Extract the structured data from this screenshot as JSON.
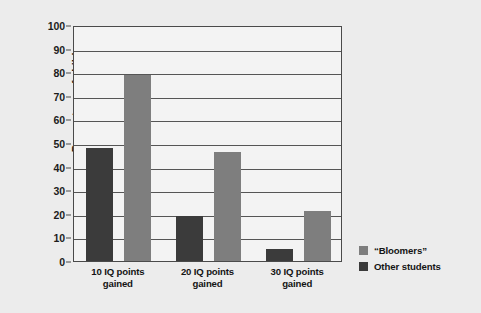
{
  "chart_data": {
    "type": "bar",
    "title": "",
    "xlabel": "",
    "ylabel": "Percentage of children",
    "ylim": [
      0,
      100
    ],
    "ytick_step": 10,
    "yticks": [
      0,
      10,
      20,
      30,
      40,
      50,
      60,
      70,
      80,
      90,
      100
    ],
    "grid": true,
    "categories": [
      "10 IQ points gained",
      "20 IQ points gained",
      "30 IQ points gained"
    ],
    "category_lines": [
      [
        "10 IQ points",
        "gained"
      ],
      [
        "20 IQ points",
        "gained"
      ],
      [
        "30 IQ points",
        "gained"
      ]
    ],
    "series": [
      {
        "name": "Other students",
        "color": "#3b3b3b",
        "values": [
          48,
          19,
          5
        ]
      },
      {
        "name": "“Bloomers”",
        "color": "#7e7e7e",
        "values": [
          79,
          46,
          21
        ]
      }
    ],
    "legend": {
      "position": "right",
      "entries": [
        {
          "label": "“Bloomers”",
          "color": "#7e7e7e"
        },
        {
          "label": "Other students",
          "color": "#3b3b3b"
        }
      ]
    }
  },
  "colors": {
    "background": "#ececec",
    "plot_background": "#f3f3f3",
    "axis": "#4a4a4a",
    "grid": "#555555",
    "text": "#141414",
    "bar_dark": "#3b3b3b",
    "bar_light": "#7e7e7e"
  }
}
